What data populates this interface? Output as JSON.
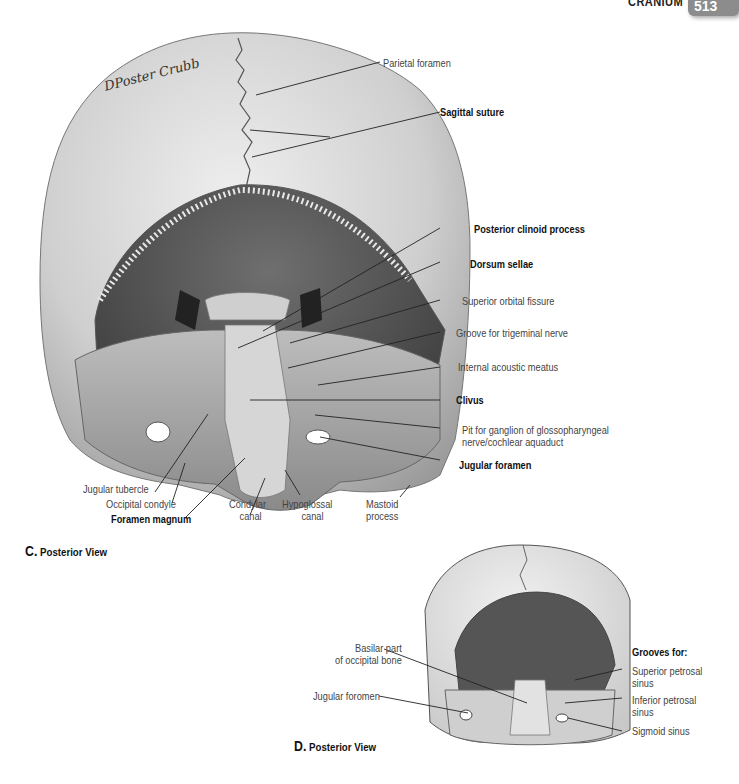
{
  "header": {
    "section_title": "CRANIUM",
    "page_number": "513"
  },
  "signature": "DPoster Crubb",
  "figure_c": {
    "caption_letter": "C.",
    "caption_text": "Posterior View",
    "labels": {
      "parietal_foramen": "Parietal foramen",
      "sagittal_suture": "Sagittal suture",
      "posterior_clinoid_process": "Posterior clinoid process",
      "dorsum_sellae": "Dorsum sellae",
      "superior_orbital_fissure": "Superior orbital fissure",
      "groove_trigeminal": "Groove for trigeminal nerve",
      "internal_acoustic_meatus": "Internal acoustic meatus",
      "clivus": "Clivus",
      "pit_ganglion_line1": "Pit for ganglion of glossopharyngeal",
      "pit_ganglion_line2": "nerve/cochlear aquaduct",
      "jugular_foramen": "Jugular foramen",
      "jugular_tubercle": "Jugular tubercle",
      "occipital_condyle": "Occipital condyle",
      "foramen_magnum": "Foramen magnum",
      "condylar_canal_line1": "Condylar",
      "condylar_canal_line2": "canal",
      "hypoglossal_canal_line1": "Hypoglossal",
      "hypoglossal_canal_line2": "canal",
      "mastoid_process_line1": "Mastoid",
      "mastoid_process_line2": "process"
    }
  },
  "figure_d": {
    "caption_letter": "D.",
    "caption_text": "Posterior View",
    "labels": {
      "basilar_part_line1": "Basilar part",
      "basilar_part_line2": "of occipital bone",
      "jugular_foramen": "Jugular foromen",
      "grooves_for": "Grooves for:",
      "superior_petrosal_line1": "Superior petrosal",
      "superior_petrosal_line2": "sinus",
      "inferior_petrosal_line1": "Inferior petrosal",
      "inferior_petrosal_line2": "sinus",
      "sigmoid_sinus": "Sigmoid sinus"
    }
  }
}
